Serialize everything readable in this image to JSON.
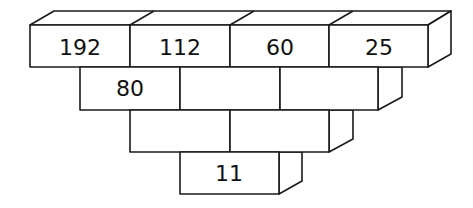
{
  "diagram": {
    "type": "number-pyramid",
    "rows": [
      {
        "cells": [
          "192",
          "112",
          "60",
          "25"
        ]
      },
      {
        "cells": [
          "80",
          "",
          ""
        ]
      },
      {
        "cells": [
          "",
          ""
        ]
      },
      {
        "cells": [
          "11"
        ]
      }
    ],
    "colors": {
      "stroke": "#1a1a1a",
      "fill": "#ffffff",
      "text": "#111111"
    }
  }
}
